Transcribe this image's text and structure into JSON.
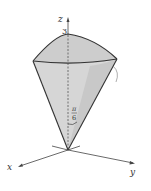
{
  "diagram": {
    "type": "spherical-cone",
    "axes": {
      "x_label": "x",
      "y_label": "y",
      "z_label": "z"
    },
    "z_intercept_label": "3",
    "angle_label": {
      "numerator": "π",
      "denominator": "6"
    },
    "colors": {
      "fill": "#d4d4d4",
      "fill_dark": "#c4c4c4",
      "stroke": "#333333"
    }
  }
}
